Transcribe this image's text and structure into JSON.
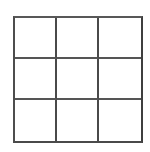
{
  "figure": {
    "name": "3x3 grid",
    "background_color": "#ffffff",
    "line_color": "#4d4d4d",
    "line_width_px": 2,
    "rows": 3,
    "columns": 3,
    "cells": [
      {
        "id": "r1c1",
        "row": 1,
        "column": 1,
        "label": ""
      },
      {
        "id": "r1c2",
        "row": 1,
        "column": 2,
        "label": ""
      },
      {
        "id": "r1c3",
        "row": 1,
        "column": 3,
        "label": ""
      },
      {
        "id": "r2c1",
        "row": 2,
        "column": 1,
        "label": ""
      },
      {
        "id": "r2c2",
        "row": 2,
        "column": 2,
        "label": ""
      },
      {
        "id": "r2c3",
        "row": 2,
        "column": 3,
        "label": ""
      },
      {
        "id": "r3c1",
        "row": 3,
        "column": 1,
        "label": ""
      },
      {
        "id": "r3c2",
        "row": 3,
        "column": 2,
        "label": ""
      },
      {
        "id": "r3c3",
        "row": 3,
        "column": 3,
        "label": ""
      }
    ]
  }
}
